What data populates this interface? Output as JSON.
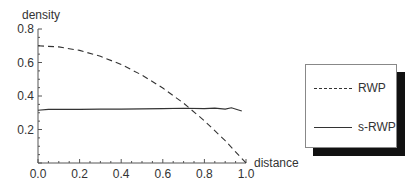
{
  "chart_data": {
    "type": "line",
    "title": "",
    "xlabel": "distance",
    "ylabel": "density",
    "xlim": [
      0.0,
      1.0
    ],
    "ylim": [
      0.0,
      0.8
    ],
    "xticks": [
      "0.0",
      "0.2",
      "0.4",
      "0.6",
      "0.8",
      "1.0"
    ],
    "yticks": [
      "0.2",
      "0.4",
      "0.6",
      "0.8"
    ],
    "grid": false,
    "legend_position": "right, outside plot, boxed with drop shadow",
    "series": [
      {
        "name": "RWP",
        "style": "dashed",
        "x": [
          0.0,
          0.1,
          0.2,
          0.3,
          0.4,
          0.5,
          0.6,
          0.7,
          0.8,
          0.9,
          1.0
        ],
        "y": [
          0.7,
          0.693,
          0.672,
          0.637,
          0.588,
          0.525,
          0.448,
          0.357,
          0.252,
          0.133,
          0.0
        ]
      },
      {
        "name": "s-RWP",
        "style": "solid",
        "x": [
          0.0,
          0.05,
          0.1,
          0.2,
          0.3,
          0.4,
          0.5,
          0.6,
          0.7,
          0.8,
          0.85,
          0.9,
          0.93,
          0.96,
          0.98
        ],
        "y": [
          0.315,
          0.32,
          0.32,
          0.32,
          0.322,
          0.322,
          0.323,
          0.325,
          0.327,
          0.325,
          0.328,
          0.322,
          0.33,
          0.318,
          0.31
        ]
      }
    ]
  },
  "legend": {
    "items": [
      {
        "label": "RWP",
        "style": "dashed"
      },
      {
        "label": "s-RWP",
        "style": "solid"
      }
    ]
  }
}
